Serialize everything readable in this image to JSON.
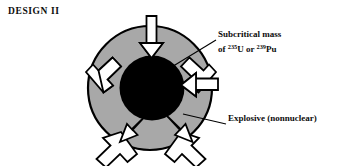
{
  "title": {
    "text": "DESIGN II"
  },
  "diagram": {
    "name": "implosion-design-diagram",
    "shell": {
      "name": "explosive-shell",
      "fill_color": "#a8a8a8",
      "stroke_color": "#000000",
      "center_x": 150,
      "center_y": 88,
      "radius": 62
    },
    "core": {
      "name": "subcritical-core",
      "fill_color": "#000000",
      "center_x": 152,
      "center_y": 88,
      "radius": 32
    },
    "arrows": {
      "count": 6,
      "fill_color": "#ffffff",
      "stroke_color": "#000000",
      "directions": [
        "top-down",
        "upper-left-inward",
        "right-inward",
        "lower-left-up",
        "lower-right-up",
        "upper-right-inward"
      ]
    }
  },
  "labels": {
    "subcritical": {
      "line1": "Subcritical mass",
      "line2_prefix": "of ",
      "line2_sup1": "235",
      "line2_mid1": "U or ",
      "line2_sup2": "239",
      "line2_mid2": "Pu"
    },
    "explosive": {
      "text": "Explosive (nonnuclear)"
    }
  },
  "colors": {
    "background": "#ffffff",
    "ink": "#0d0d0d",
    "shell_gray": "#a8a8a8",
    "core_black": "#000000",
    "arrow_white": "#ffffff"
  }
}
